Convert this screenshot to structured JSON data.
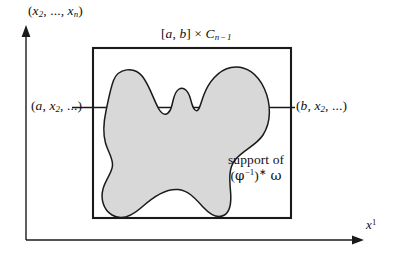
{
  "figure": {
    "type": "mathematical-diagram",
    "background_color": "#ffffff",
    "line_color": "#1a1a1a",
    "blob_fill_color": "#d8d8d8",
    "blob_stroke_color": "#1a1a1a",
    "axes": {
      "y_axis_label": "(x2, …, xn)",
      "x_axis_label": "x1",
      "y_axis_label_parts": {
        "open": "(",
        "first": "x",
        "first_sub": "2",
        "ellipsis": ", …, ",
        "last": "x",
        "last_sub": "n",
        "close": ")"
      },
      "x_axis_label_parts": {
        "base": "x",
        "sup": "1"
      }
    },
    "box": {
      "label": "[a, b] × C n−1",
      "label_parts": {
        "interval": "[a, b]",
        "times": "×",
        "base": "C",
        "sub": "n − 1"
      }
    },
    "points": {
      "left": "(a, x2, …)",
      "left_parts": {
        "open": "(",
        "first": "a",
        "mid": ", ",
        "x": "x",
        "x_sub": "2",
        "tail": ", …)"
      },
      "right": "(b, x2, …)",
      "right_parts": {
        "open": "(",
        "first": "b",
        "mid": ", ",
        "x": "x",
        "x_sub": "2",
        "tail": ", …)"
      }
    },
    "annotation": {
      "line1": "support of",
      "line2": "(φ−1)* ω",
      "line2_parts": {
        "open": "(",
        "phi": "φ",
        "exp": "−1",
        "close": ")",
        "star": "*",
        "omega": "ω"
      }
    }
  }
}
